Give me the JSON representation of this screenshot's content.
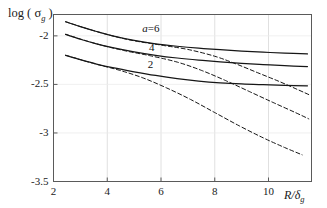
{
  "chart_data": {
    "type": "line",
    "title": "",
    "xlabel": "R/δg",
    "xlabel_main": "R/δ",
    "xlabel_sub": "g",
    "ylabel_main": "log ( σ",
    "ylabel_sub": "g",
    "ylabel_close": " )",
    "ylabel": "log ( σg )",
    "xlim": [
      2,
      11.6
    ],
    "ylim": [
      -3.5,
      -1.78
    ],
    "xticks": [
      2,
      4,
      6,
      8,
      10
    ],
    "xtick_labels": [
      "2",
      "4",
      "6",
      "8",
      "10"
    ],
    "yticks": [
      -2,
      -2.5,
      -3,
      -3.5
    ],
    "ytick_labels": [
      "-2",
      "-2.5",
      "-3",
      "-3.5"
    ],
    "grid": "vertical light gridlines at x = 4, 6, 8, 10 and horizontal faint lines at y = -2, -2.5, -3",
    "legend_position": "inline curve labels",
    "annotations": [
      {
        "text": "a=6",
        "x": 6.05,
        "y": -1.93
      },
      {
        "text": "4",
        "x": 6.3,
        "y": -2.12
      },
      {
        "text": "2",
        "x": 6.25,
        "y": -2.3
      }
    ],
    "series": [
      {
        "name": "a=6 solid",
        "style": "solid",
        "label": "a=6",
        "points": [
          [
            2.45,
            -1.855
          ],
          [
            3.0,
            -1.905
          ],
          [
            3.6,
            -1.955
          ],
          [
            4.2,
            -2.0
          ],
          [
            5.0,
            -2.047
          ],
          [
            5.8,
            -2.082
          ],
          [
            6.6,
            -2.107
          ],
          [
            7.4,
            -2.127
          ],
          [
            8.2,
            -2.143
          ],
          [
            9.0,
            -2.157
          ],
          [
            9.8,
            -2.168
          ],
          [
            10.6,
            -2.178
          ],
          [
            11.45,
            -2.186
          ]
        ]
      },
      {
        "name": "a=4 solid",
        "style": "solid",
        "label": "4",
        "points": [
          [
            2.45,
            -1.985
          ],
          [
            3.0,
            -2.035
          ],
          [
            3.6,
            -2.082
          ],
          [
            4.2,
            -2.122
          ],
          [
            5.0,
            -2.165
          ],
          [
            5.8,
            -2.2
          ],
          [
            6.6,
            -2.228
          ],
          [
            7.4,
            -2.25
          ],
          [
            8.2,
            -2.268
          ],
          [
            9.0,
            -2.283
          ],
          [
            9.8,
            -2.296
          ],
          [
            10.6,
            -2.307
          ],
          [
            11.45,
            -2.316
          ]
        ]
      },
      {
        "name": "a=2 solid",
        "style": "solid",
        "label": "2",
        "points": [
          [
            2.45,
            -2.2
          ],
          [
            3.0,
            -2.245
          ],
          [
            3.6,
            -2.29
          ],
          [
            4.2,
            -2.328
          ],
          [
            5.0,
            -2.37
          ],
          [
            5.8,
            -2.408
          ],
          [
            6.6,
            -2.44
          ],
          [
            7.4,
            -2.465
          ],
          [
            8.2,
            -2.483
          ],
          [
            9.0,
            -2.495
          ],
          [
            9.8,
            -2.503
          ],
          [
            10.6,
            -2.51
          ],
          [
            11.45,
            -2.515
          ]
        ]
      },
      {
        "name": "a=6 dashed",
        "style": "dashed",
        "points": [
          [
            2.45,
            -1.855
          ],
          [
            3.6,
            -1.955
          ],
          [
            4.8,
            -2.04
          ],
          [
            6.0,
            -2.095
          ],
          [
            7.0,
            -2.14
          ],
          [
            8.0,
            -2.21
          ],
          [
            8.8,
            -2.29
          ],
          [
            9.6,
            -2.38
          ],
          [
            10.4,
            -2.47
          ],
          [
            11.1,
            -2.555
          ],
          [
            11.5,
            -2.605
          ]
        ]
      },
      {
        "name": "a=4 dashed",
        "style": "dashed",
        "points": [
          [
            2.45,
            -1.985
          ],
          [
            3.6,
            -2.082
          ],
          [
            4.6,
            -2.15
          ],
          [
            5.6,
            -2.205
          ],
          [
            6.6,
            -2.27
          ],
          [
            7.5,
            -2.355
          ],
          [
            8.4,
            -2.46
          ],
          [
            9.3,
            -2.575
          ],
          [
            10.2,
            -2.69
          ],
          [
            11.0,
            -2.79
          ],
          [
            11.5,
            -2.855
          ]
        ]
      },
      {
        "name": "a=2 dashed",
        "style": "dashed",
        "points": [
          [
            2.45,
            -2.2
          ],
          [
            3.5,
            -2.285
          ],
          [
            4.4,
            -2.35
          ],
          [
            5.3,
            -2.43
          ],
          [
            6.2,
            -2.535
          ],
          [
            7.1,
            -2.655
          ],
          [
            8.0,
            -2.79
          ],
          [
            8.9,
            -2.925
          ],
          [
            9.8,
            -3.05
          ],
          [
            10.6,
            -3.15
          ],
          [
            11.25,
            -3.225
          ]
        ]
      }
    ]
  },
  "axes": {
    "ylabel_text": "log ( σg )",
    "xlabel_text": "R/δg"
  },
  "colors": {
    "curve": "#161616",
    "frame": "#5a5a5a",
    "grid": "#d8d8d8",
    "background": "#ffffff",
    "text": "#1a1a1a"
  }
}
